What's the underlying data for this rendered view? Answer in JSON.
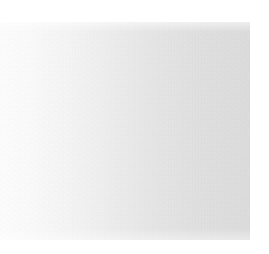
{
  "panel": {
    "state": "blank",
    "content_text": "",
    "colors": {
      "page_background": "#ffffff",
      "panel_gradient_start": "#fdfdfd",
      "panel_gradient_end": "#dcdcdc"
    },
    "geometry": {
      "left": 0,
      "top": 22,
      "width": 250,
      "height": 218
    }
  },
  "viewport": {
    "width": 269,
    "height": 254,
    "background": "#ffffff"
  }
}
